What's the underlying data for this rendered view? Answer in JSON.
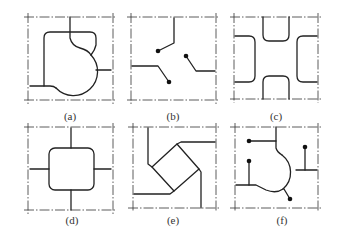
{
  "figure": {
    "panels": [
      {
        "id": "a",
        "label": "(a)",
        "description": "rounded square with circular bulge, two corner connections"
      },
      {
        "id": "b",
        "label": "(b)",
        "description": "three bent wires ending in dots"
      },
      {
        "id": "c",
        "label": "(c)",
        "description": "four rounded rectangles at frame edges forming a cross-shaped gap"
      },
      {
        "id": "d",
        "label": "(d)",
        "description": "rounded square centered with four orthogonal connections"
      },
      {
        "id": "e",
        "label": "(e)",
        "description": "rotated square with two L-shaped connections"
      },
      {
        "id": "f",
        "label": "(f)",
        "description": "circular bulge shape with dotted terminal wires"
      }
    ],
    "colors": {
      "line": "#222222",
      "background": "#ffffff"
    }
  }
}
